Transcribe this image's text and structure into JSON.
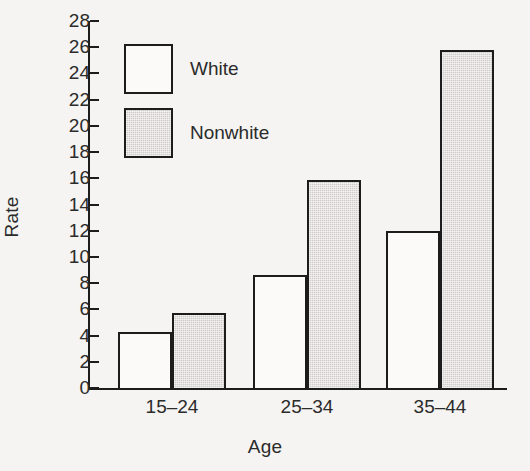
{
  "chart_data": {
    "type": "bar",
    "title": "",
    "xlabel": "Age",
    "ylabel": "Rate",
    "categories": [
      "15–24",
      "25–34",
      "35–44"
    ],
    "series": [
      {
        "name": "White",
        "values": [
          4.3,
          8.6,
          12.0
        ],
        "fill": "#fbfaf9",
        "style": "open"
      },
      {
        "name": "Nonwhite",
        "values": [
          5.7,
          15.9,
          25.8
        ],
        "fill": "#cfcbc8",
        "style": "shaded"
      }
    ],
    "ylim": [
      0,
      28
    ],
    "ytick_step": 2,
    "yticks": [
      0,
      2,
      4,
      6,
      8,
      10,
      12,
      14,
      16,
      18,
      20,
      22,
      24,
      26,
      28
    ],
    "ytick_labels": [
      "0",
      "2",
      "4",
      "6",
      "8",
      "10",
      "12",
      "14",
      "16",
      "18",
      "20",
      "22",
      "24",
      "26",
      "28"
    ],
    "grid": false,
    "legend_position": "upper-left-inside",
    "legend_entries": [
      "White",
      "Nonwhite"
    ],
    "axis_color": "#1c1c1c",
    "background": "#f5f4f2"
  }
}
